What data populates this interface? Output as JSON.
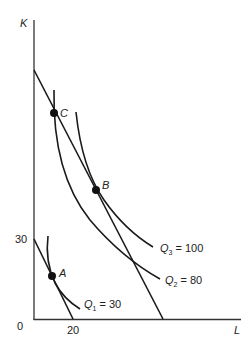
{
  "diagram": {
    "type": "isoquant-isocost",
    "axes": {
      "y_label": "K",
      "x_label": "L",
      "origin_label": "0",
      "y_tick": "30",
      "x_tick": "20"
    },
    "points": [
      {
        "label": "A"
      },
      {
        "label": "B"
      },
      {
        "label": "C"
      }
    ],
    "isoquants": [
      {
        "q": "Q",
        "sub": "1",
        "eq": " = 30"
      },
      {
        "q": "Q",
        "sub": "2",
        "eq": " = 80"
      },
      {
        "q": "Q",
        "sub": "3",
        "eq": " = 100"
      }
    ],
    "colors": {
      "line": "#1a1a1a",
      "background": "#ffffff"
    }
  }
}
